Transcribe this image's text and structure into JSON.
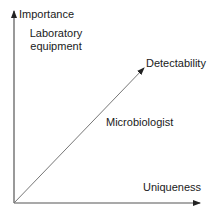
{
  "diagram": {
    "y_axis_label": "Importance",
    "x_axis_label": "Uniqueness",
    "diagonal_label_end": "Detectability",
    "diagonal_label_mid": "Microbiologist",
    "top_left_label_line1": "Laboratory",
    "top_left_label_line2": "equipment",
    "colors": {
      "axis": "#555555",
      "diagonal": "#777777",
      "text": "#1a1a1a",
      "background": "#ffffff"
    }
  }
}
